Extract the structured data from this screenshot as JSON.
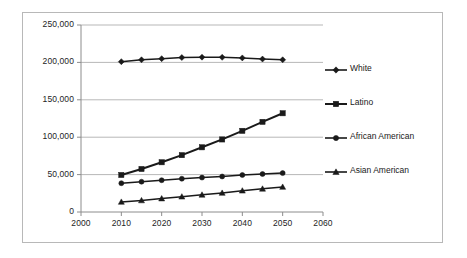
{
  "chart_data": {
    "type": "line",
    "title": "",
    "xlabel": "",
    "ylabel": "",
    "x": [
      2010,
      2015,
      2020,
      2025,
      2030,
      2035,
      2040,
      2045,
      2050
    ],
    "xlim": [
      2000,
      2060
    ],
    "ylim": [
      0,
      250000
    ],
    "xticks": [
      "2000",
      "2010",
      "2020",
      "2030",
      "2040",
      "2050",
      "2060"
    ],
    "xtick_values": [
      2000,
      2010,
      2020,
      2030,
      2040,
      2050,
      2060
    ],
    "yticks": [
      "0",
      "50,000",
      "100,000",
      "150,000",
      "200,000",
      "250,000"
    ],
    "ytick_values": [
      0,
      50000,
      100000,
      150000,
      200000,
      250000
    ],
    "grid": "horizontal",
    "legend_position": "right",
    "series": [
      {
        "name": "White",
        "marker": "diamond",
        "color": "#1a1a1a",
        "values": [
          201000,
          203500,
          205000,
          206500,
          207000,
          206800,
          206000,
          204500,
          203500
        ]
      },
      {
        "name": "Latino",
        "marker": "square",
        "color": "#1a1a1a",
        "values": [
          49500,
          57500,
          66500,
          76000,
          86500,
          97000,
          108500,
          120500,
          132000
        ]
      },
      {
        "name": "African American",
        "marker": "circle",
        "color": "#1a1a1a",
        "values": [
          38500,
          40500,
          42500,
          44500,
          46000,
          47500,
          49500,
          50800,
          52000
        ]
      },
      {
        "name": "Asian American",
        "marker": "triangle",
        "color": "#1a1a1a",
        "values": [
          13500,
          15500,
          18000,
          20500,
          23000,
          25500,
          28500,
          31000,
          33500
        ]
      }
    ]
  },
  "legend": {
    "items": [
      {
        "label": "White",
        "marker": "diamond"
      },
      {
        "label": "Latino",
        "marker": "square"
      },
      {
        "label": "African American",
        "marker": "circle"
      },
      {
        "label": "Asian American",
        "marker": "triangle"
      }
    ]
  },
  "colors": {
    "line": "#1a1a1a",
    "grid": "#9a9a9a",
    "axis": "#8c8c8c",
    "frame": "#b8b8b8",
    "text": "#242424"
  }
}
